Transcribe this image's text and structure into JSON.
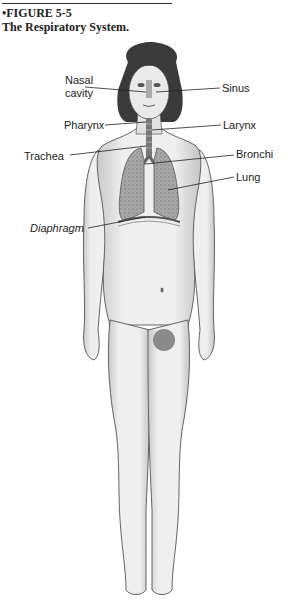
{
  "figure": {
    "number": "•FIGURE 5-5",
    "title": "The Respiratory System."
  },
  "labels": {
    "nasal_cavity_line1": "Nasal",
    "nasal_cavity_line2": "cavity",
    "sinus": "Sinus",
    "pharynx": "Pharynx",
    "larynx": "Larynx",
    "trachea": "Trachea",
    "bronchi": "Bronchi",
    "lung": "Lung",
    "diaphragm": "Diaphragm"
  },
  "colors": {
    "skin": "#e9e9e9",
    "outline": "#555555",
    "hair": "#3a3a3a",
    "lung": "#9a9a9a",
    "text": "#222222"
  }
}
